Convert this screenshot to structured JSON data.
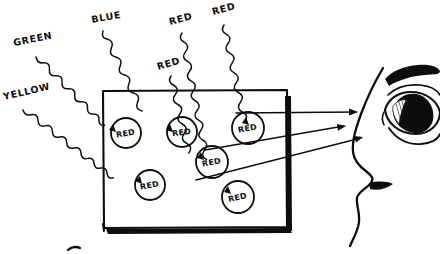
{
  "diagram": {
    "title": "Incoming light wavelengths absorbed by a red surface, red reflected to the eye",
    "background_color": "#ffffff",
    "ink_color": "#0d0d0d",
    "surface": {
      "name": "red-surface-panel",
      "shape": "rectangle",
      "x": 102,
      "y": 90,
      "width": 186,
      "height": 138,
      "right_edge_style": "thick-black-bar",
      "bottom_edge_style": "thick-black-shadow"
    },
    "incoming_waves": [
      {
        "id": "wave-green",
        "label": "GREEN",
        "label_x": 14,
        "label_y": 46,
        "label_rotate": -11
      },
      {
        "id": "wave-yellow",
        "label": "YELLOW",
        "label_x": 4,
        "label_y": 100,
        "label_rotate": -13
      },
      {
        "id": "wave-blue",
        "label": "BLUE",
        "label_x": 92,
        "label_y": 23,
        "label_rotate": -10
      },
      {
        "id": "wave-red-1",
        "label": "RED",
        "label_x": 158,
        "label_y": 70,
        "label_rotate": -16
      },
      {
        "id": "wave-red-2",
        "label": "RED",
        "label_x": 170,
        "label_y": 25,
        "label_rotate": -15
      },
      {
        "id": "wave-red-3",
        "label": "RED",
        "label_x": 213,
        "label_y": 15,
        "label_rotate": -15
      }
    ],
    "absorption_dots": [
      {
        "id": "dot-1",
        "label": "RED",
        "cx": 126,
        "cy": 133,
        "r": 15,
        "label_rotate": -9
      },
      {
        "id": "dot-2",
        "label": "RED",
        "cx": 182,
        "cy": 132,
        "r": 15,
        "label_rotate": -8
      },
      {
        "id": "dot-3",
        "label": "RED",
        "cx": 248,
        "cy": 128,
        "r": 16,
        "label_rotate": -10
      },
      {
        "id": "dot-4",
        "label": "RED",
        "cx": 212,
        "cy": 162,
        "r": 16,
        "label_rotate": -11
      },
      {
        "id": "dot-5",
        "label": "RED",
        "cx": 238,
        "cy": 197,
        "r": 16,
        "label_rotate": -12
      },
      {
        "id": "dot-6",
        "label": "RED",
        "cx": 150,
        "cy": 185,
        "r": 15,
        "label_rotate": -10
      }
    ],
    "reflected_rays": [
      {
        "id": "ray-top",
        "x1": 236,
        "y1": 113,
        "x2": 356,
        "y2": 112
      },
      {
        "id": "ray-middle",
        "x1": 205,
        "y1": 150,
        "x2": 344,
        "y2": 126
      },
      {
        "id": "ray-bottom",
        "x1": 196,
        "y1": 180,
        "x2": 362,
        "y2": 137
      }
    ],
    "observer": {
      "name": "human-face-profile",
      "parts": [
        "eyebrow",
        "upper-eyelid",
        "eyeball",
        "iris",
        "pupil-highlight",
        "lower-eyelid",
        "nose-profile",
        "lips",
        "chin"
      ]
    }
  }
}
